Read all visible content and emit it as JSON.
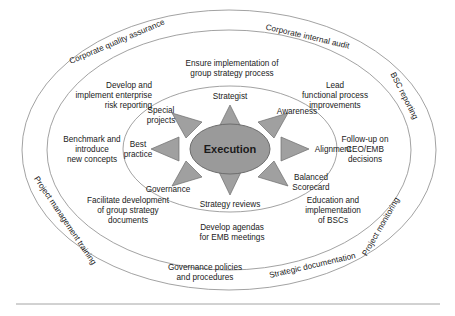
{
  "core": {
    "label": "Execution"
  },
  "colors": {
    "core_fill": "#9a9a9a",
    "arrow_fill": "#a0a0a0",
    "ellipse_stroke": "#8a8a8a",
    "text": "#1a1a1a",
    "background": "#ffffff"
  },
  "inner_ring": {
    "items": [
      {
        "label": "Strategist"
      },
      {
        "label": "Awareness"
      },
      {
        "label": "Alignment"
      },
      {
        "label_line1": "Balanced",
        "label_line2": "Scorecard"
      },
      {
        "label": "Strategy reviews"
      },
      {
        "label": "Governance"
      },
      {
        "label_line1": "Best",
        "label_line2": "practice"
      },
      {
        "label_line1": "Special",
        "label_line2": "projects"
      }
    ]
  },
  "middle_ring": {
    "items": [
      {
        "line1": "Ensure implementation of",
        "line2": "group strategy process"
      },
      {
        "line1": "Lead",
        "line2": "functional process",
        "line3": "improvements"
      },
      {
        "line1": "Follow-up on",
        "line2": "CEO/EMB",
        "line3": "decisions"
      },
      {
        "line1": "Education and",
        "line2": "implementation",
        "line3": "of BSCs"
      },
      {
        "line1": "Develop agendas",
        "line2": "for EMB meetings"
      },
      {
        "line1": "Facilitate development",
        "line2": "of group strategy",
        "line3": "documents"
      },
      {
        "line1": "Benchmark and",
        "line2": "introduce",
        "line3": "new concepts"
      },
      {
        "line1": "Develop and",
        "line2": "implement enterprise",
        "line3": "risk reporting"
      }
    ]
  },
  "outer_ring": {
    "items": [
      {
        "label": "Corporate quality assurance"
      },
      {
        "label": "Corporate internal audit"
      },
      {
        "label": "BSC reporting"
      },
      {
        "label": "Project monitoring"
      },
      {
        "label": "Strategic documentation"
      },
      {
        "line1": "Governance policies",
        "line2": "and procedures"
      },
      {
        "label": "Project management training"
      }
    ]
  }
}
